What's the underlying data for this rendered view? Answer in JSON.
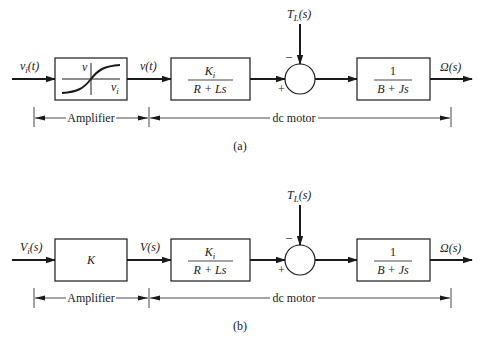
{
  "panels": [
    {
      "id": "a",
      "caption": "(a)",
      "input_label": "v",
      "input_sub": "i",
      "input_arg": "(t)",
      "amplifier_block": {
        "type": "saturation-curve",
        "axis_v": "v",
        "axis_vi": "v",
        "axis_vi_sub": "i"
      },
      "mid_label": "v(t)",
      "block1": {
        "num": "K",
        "num_sub": "i",
        "den": "R + Ls"
      },
      "disturbance": {
        "label": "T",
        "sub": "L",
        "arg": "(s)",
        "sign": "–"
      },
      "sum_plus": "+",
      "block2": {
        "num": "1",
        "den": "B + Js"
      },
      "output_label": "Ω(s)",
      "dim_amplifier": "Amplifier",
      "dim_motor": "dc motor"
    },
    {
      "id": "b",
      "caption": "(b)",
      "input_label": "V",
      "input_sub": "i",
      "input_arg": "(s)",
      "amplifier_block": {
        "type": "gain",
        "gain": "K"
      },
      "mid_label": "V(s)",
      "block1": {
        "num": "K",
        "num_sub": "i",
        "den": "R + Ls"
      },
      "disturbance": {
        "label": "T",
        "sub": "L",
        "arg": "(s)",
        "sign": "–"
      },
      "sum_plus": "+",
      "block2": {
        "num": "1",
        "den": "B + Js"
      },
      "output_label": "Ω(s)",
      "dim_amplifier": "Amplifier",
      "dim_motor": "dc motor"
    }
  ]
}
